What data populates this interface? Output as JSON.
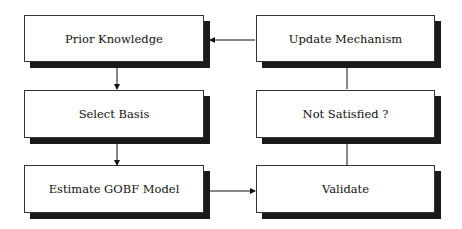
{
  "diagram": {
    "type": "flowchart",
    "nodes": [
      {
        "id": "prior",
        "label": "Prior Knowledge"
      },
      {
        "id": "basis",
        "label": "Select Basis"
      },
      {
        "id": "estimate",
        "label": "Estimate GOBF Model"
      },
      {
        "id": "validate",
        "label": "Validate"
      },
      {
        "id": "notsat",
        "label": "Not Satisfied ?"
      },
      {
        "id": "update",
        "label": "Update Mechanism"
      }
    ],
    "edges": [
      {
        "from": "prior",
        "to": "basis"
      },
      {
        "from": "basis",
        "to": "estimate"
      },
      {
        "from": "estimate",
        "to": "validate"
      },
      {
        "from": "validate",
        "to": "notsat"
      },
      {
        "from": "notsat",
        "to": "update"
      },
      {
        "from": "update",
        "to": "prior"
      }
    ]
  }
}
